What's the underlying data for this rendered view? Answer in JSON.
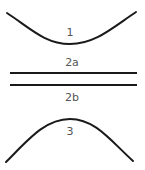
{
  "diagram": {
    "stroke_color": "#1a1a1a",
    "label_color": "#555555",
    "elements": [
      {
        "id": "1",
        "kind": "concave-up-curve",
        "label": "1"
      },
      {
        "id": "2a",
        "kind": "horizontal-line",
        "label": "2a"
      },
      {
        "id": "2b",
        "kind": "horizontal-line",
        "label": "2b"
      },
      {
        "id": "3",
        "kind": "concave-down-curve",
        "label": "3"
      }
    ]
  }
}
